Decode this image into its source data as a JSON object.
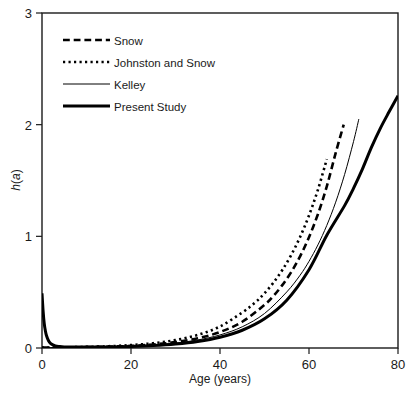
{
  "chart_data": {
    "type": "line",
    "title": "",
    "xlabel": "Age (years)",
    "ylabel": "h(a)",
    "ylabel_parts": {
      "func": "h",
      "open": "(",
      "arg": "a",
      "close": ")"
    },
    "xlim": [
      0,
      80
    ],
    "ylim": [
      0,
      3
    ],
    "xticks": [
      0,
      20,
      40,
      60,
      80
    ],
    "yticks": [
      0,
      1,
      2,
      3
    ],
    "xtick_labels": [
      "0",
      "20",
      "40",
      "60",
      "80"
    ],
    "ytick_labels": [
      "0",
      "1",
      "2",
      "3"
    ],
    "grid": false,
    "frame": "box",
    "legend_position": "upper-left",
    "series": [
      {
        "name": "Snow",
        "style": "dashed",
        "stroke_width": 2.6,
        "color": "#000000",
        "x": [
          0,
          2,
          5,
          10,
          15,
          20,
          25,
          30,
          35,
          40,
          45,
          50,
          52,
          54,
          56,
          58,
          60,
          62,
          64,
          66,
          67.8
        ],
        "y": [
          0.004,
          0.004,
          0.005,
          0.008,
          0.012,
          0.019,
          0.032,
          0.053,
          0.087,
          0.143,
          0.235,
          0.386,
          0.466,
          0.563,
          0.68,
          0.821,
          0.992,
          1.198,
          1.447,
          1.748,
          2.0
        ]
      },
      {
        "name": "Johnston and Snow",
        "style": "dotted",
        "stroke_width": 2.6,
        "color": "#000000",
        "x": [
          0,
          2,
          5,
          10,
          15,
          20,
          25,
          30,
          35,
          40,
          45,
          48,
          50,
          52,
          54,
          56,
          58,
          60,
          62,
          64
        ],
        "y": [
          0.005,
          0.005,
          0.006,
          0.01,
          0.016,
          0.026,
          0.043,
          0.071,
          0.117,
          0.193,
          0.318,
          0.411,
          0.49,
          0.585,
          0.698,
          0.833,
          0.994,
          1.187,
          1.417,
          1.691
        ]
      },
      {
        "name": "Kelley",
        "style": "solid",
        "stroke_width": 1.0,
        "color": "#000000",
        "x": [
          0,
          2,
          5,
          10,
          15,
          20,
          25,
          30,
          35,
          40,
          45,
          50,
          55,
          58,
          60,
          62,
          64,
          66,
          68,
          70,
          71.2
        ],
        "y": [
          0.004,
          0.004,
          0.005,
          0.007,
          0.011,
          0.017,
          0.027,
          0.044,
          0.072,
          0.117,
          0.19,
          0.309,
          0.502,
          0.652,
          0.776,
          0.923,
          1.098,
          1.306,
          1.554,
          1.848,
          2.05
        ]
      },
      {
        "name": "Present Study",
        "style": "solid",
        "stroke_width": 3.0,
        "color": "#000000",
        "x": [
          0,
          0.25,
          0.5,
          0.75,
          1,
          1.5,
          2,
          3,
          4,
          5,
          7,
          10,
          15,
          20,
          25,
          30,
          35,
          40,
          45,
          50,
          55,
          60,
          64,
          68,
          70,
          72,
          74,
          76,
          78,
          80
        ],
        "y": [
          0.49,
          0.33,
          0.22,
          0.155,
          0.112,
          0.062,
          0.038,
          0.019,
          0.013,
          0.01,
          0.008,
          0.008,
          0.01,
          0.014,
          0.022,
          0.036,
          0.059,
          0.097,
          0.159,
          0.261,
          0.428,
          0.701,
          1.01,
          1.275,
          1.43,
          1.602,
          1.794,
          1.965,
          2.115,
          2.26
        ]
      }
    ],
    "legend_entries": [
      {
        "label": "Snow",
        "style": "dashed",
        "stroke_width": 2.6
      },
      {
        "label": "Johnston and Snow",
        "style": "dotted",
        "stroke_width": 2.6
      },
      {
        "label": "Kelley",
        "style": "solid",
        "stroke_width": 1.0
      },
      {
        "label": "Present Study",
        "style": "solid",
        "stroke_width": 3.0
      }
    ]
  },
  "axes": {
    "x_axis_title": "Age (years)",
    "y_axis_title": "h(a)"
  },
  "colors": {
    "background": "#ffffff",
    "ink": "#1a1a1a",
    "curve": "#000000"
  }
}
